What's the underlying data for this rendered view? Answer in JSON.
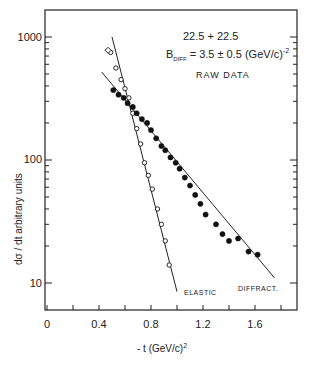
{
  "chart_data": {
    "type": "scatter",
    "title": "",
    "annotations": [
      "22.5 + 22.5",
      "B_DIFF = 3.5 ± 0.5 (GeV/c)^-2",
      "RAW DATA",
      "ELASTIC",
      "DIFFRACT."
    ],
    "xlabel": "- t  (GeV/c)²",
    "ylabel": "dσ / dt   arbitrary units",
    "xlim": [
      0,
      1.9
    ],
    "ylim": [
      7,
      1400
    ],
    "yscale": "log",
    "x_ticks": [
      "0",
      "0.4",
      "0.8",
      "1.2",
      "1.6"
    ],
    "y_ticks": [
      "10",
      "100",
      "1000"
    ],
    "grid": false,
    "series": [
      {
        "name": "ELASTIC",
        "marker": "open-circle",
        "points": [
          [
            0.49,
            750
          ],
          [
            0.53,
            560
          ],
          [
            0.57,
            450
          ],
          [
            0.6,
            380
          ],
          [
            0.63,
            320
          ],
          [
            0.66,
            240
          ],
          [
            0.69,
            180
          ],
          [
            0.72,
            135
          ],
          [
            0.75,
            95
          ],
          [
            0.78,
            75
          ],
          [
            0.81,
            58
          ],
          [
            0.85,
            40
          ],
          [
            0.88,
            30
          ],
          [
            0.91,
            22
          ],
          [
            0.94,
            14
          ]
        ],
        "fit_line": [
          [
            0.5,
            1000
          ],
          [
            1.0,
            8.5
          ]
        ]
      },
      {
        "name": "DIFFRACT.",
        "marker": "filled-circle",
        "points": [
          [
            0.51,
            370
          ],
          [
            0.55,
            340
          ],
          [
            0.59,
            320
          ],
          [
            0.62,
            290
          ],
          [
            0.66,
            270
          ],
          [
            0.69,
            240
          ],
          [
            0.73,
            215
          ],
          [
            0.77,
            200
          ],
          [
            0.8,
            175
          ],
          [
            0.84,
            150
          ],
          [
            0.88,
            130
          ],
          [
            0.91,
            120
          ],
          [
            0.95,
            105
          ],
          [
            0.99,
            95
          ],
          [
            1.02,
            85
          ],
          [
            1.06,
            72
          ],
          [
            1.1,
            62
          ],
          [
            1.14,
            52
          ],
          [
            1.18,
            44
          ],
          [
            1.22,
            36
          ],
          [
            1.3,
            30
          ],
          [
            1.35,
            25
          ],
          [
            1.4,
            22
          ],
          [
            1.47,
            23
          ],
          [
            1.55,
            18
          ],
          [
            1.62,
            17
          ]
        ],
        "fit_line": [
          [
            0.42,
            520
          ],
          [
            1.75,
            11
          ]
        ]
      }
    ]
  },
  "labels": {
    "energy": "22.5 + 22.5",
    "b_diff_prefix": "B",
    "b_diff_sub": "DIFF",
    "b_diff_value": "= 3.5 ± 0.5 (GeV/c)",
    "b_diff_exp": "-2",
    "raw": "RAW DATA",
    "elastic": "ELASTIC",
    "diffract": "DIFFRACT.",
    "xlabel": "- t  (GeV/c)",
    "xlabel_exp": "2",
    "ylabel": "dσ / dt    arbitrary units"
  },
  "ticks": {
    "x": [
      "0",
      "0.4",
      "0.8",
      "1.2",
      "1.6"
    ],
    "y": [
      "1000",
      "100",
      "10"
    ]
  }
}
